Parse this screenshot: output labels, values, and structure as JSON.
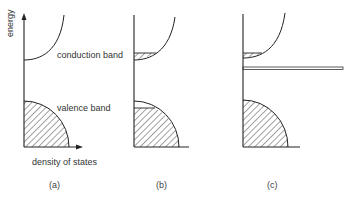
{
  "figure": {
    "y_axis_label": "energy",
    "x_axis_label": "density of states",
    "labels": {
      "conduction_band": "conduction band",
      "valence_band": "valence band"
    },
    "panels": [
      {
        "caption": "(a)",
        "description": "Filled valence band, empty conduction band"
      },
      {
        "caption": "(b)",
        "description": "Electrons excited into conduction band, holes at top of valence band"
      },
      {
        "caption": "(c)",
        "description": "Impurity/donor level in gap, partial conduction band occupancy, full valence band"
      }
    ]
  }
}
